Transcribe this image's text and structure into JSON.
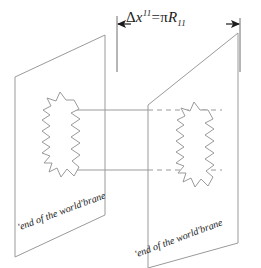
{
  "figure": {
    "width": 261,
    "height": 268,
    "background_color": "#ffffff",
    "line_color": "#9a9a9a",
    "text_color": "#1c1c1c"
  },
  "dimension": {
    "delta": "Δ",
    "variable": "x",
    "superscript": "11",
    "equals": "=",
    "pi": "π",
    "radius": "R",
    "subscript": "11",
    "full_text": "Δx¹¹ = πR₁₁",
    "arrow_left": "←",
    "arrow_right": "→"
  },
  "branes": [
    {
      "id": "left-brane",
      "label": "'end of the world'brane",
      "label_rotation_deg": -20.5
    },
    {
      "id": "right-brane",
      "label": "'end of the world'brane",
      "label_rotation_deg": -20.5
    }
  ],
  "membranes": [
    {
      "id": "left-membrane",
      "shape": "wavy-closed-blob"
    },
    {
      "id": "right-membrane",
      "shape": "wavy-closed-blob"
    }
  ],
  "connectors": [
    {
      "id": "upper-connector",
      "style": "solid-then-dashed"
    },
    {
      "id": "lower-connector",
      "style": "solid-then-dashed"
    }
  ]
}
